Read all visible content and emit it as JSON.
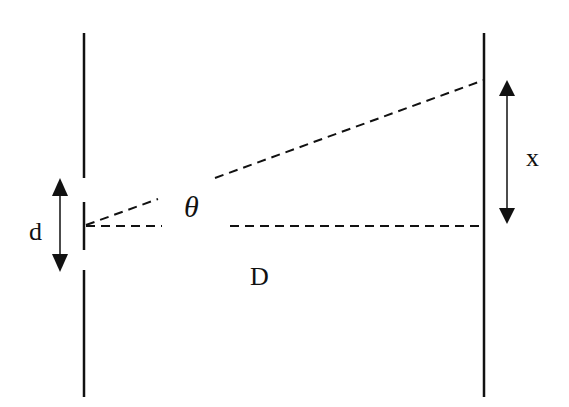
{
  "diagram": {
    "labels": {
      "slit_separation": "d",
      "angle": "θ",
      "screen_distance": "D",
      "fringe_displacement": "x"
    },
    "colors": {
      "line": "#111111",
      "background": "#ffffff"
    },
    "elements": {
      "barrier": {
        "x": 84,
        "segments": [
          [
            33,
            178
          ],
          [
            202,
            250
          ],
          [
            270,
            397
          ]
        ]
      },
      "screen": {
        "x": 484,
        "y1": 33,
        "y2": 397
      },
      "central_axis": {
        "from": [
          84,
          226
        ],
        "to": [
          484,
          226
        ]
      },
      "angled_ray": {
        "from": [
          84,
          226
        ],
        "to": [
          484,
          80
        ]
      },
      "d_arrow": {
        "x": 60,
        "y1": 178,
        "y2": 272
      },
      "x_arrow": {
        "x": 507,
        "y1": 80,
        "y2": 224
      }
    }
  }
}
